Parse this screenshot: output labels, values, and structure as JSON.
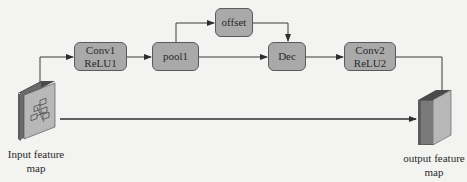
{
  "diagram": {
    "type": "flowchart",
    "colors": {
      "background": "#f3f3f1",
      "node_fill": "#a9a9a9",
      "node_border": "#5a5a5a",
      "line": "#3a3a3a",
      "block_front": "#b8b8b8",
      "block_side": "#5c5c5c",
      "block_top": "#4a4a4a"
    },
    "nodes": {
      "conv1": {
        "line1": "Conv1",
        "line2": "ReLU1"
      },
      "pool1": {
        "label": "pool1"
      },
      "offset": {
        "label": "offset"
      },
      "dec": {
        "label": "Dec"
      },
      "conv2": {
        "line1": "Conv2",
        "line2": "ReLU2"
      }
    },
    "input": {
      "line1": "Input feature",
      "line2": "map",
      "icon": "feature-map-block-with-grid-icon"
    },
    "output": {
      "line1": "output feature",
      "line2": "map",
      "icon": "feature-map-block-icon"
    },
    "edges": [
      {
        "from": "input",
        "to": "conv1"
      },
      {
        "from": "conv1",
        "to": "pool1"
      },
      {
        "from": "pool1",
        "to": "offset"
      },
      {
        "from": "pool1",
        "to": "dec"
      },
      {
        "from": "offset",
        "to": "dec"
      },
      {
        "from": "dec",
        "to": "conv2"
      },
      {
        "from": "conv2",
        "to": "output"
      },
      {
        "from": "input",
        "to": "output",
        "label": "skip connection"
      }
    ]
  }
}
